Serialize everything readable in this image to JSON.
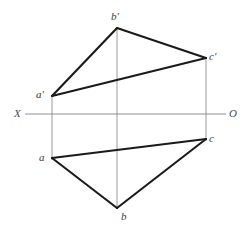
{
  "diagram": {
    "type": "orthographic-projection",
    "background_color": "#ffffff",
    "ground_line": {
      "name": "XO",
      "left_label": "X",
      "right_label": "O",
      "y": 114,
      "x_start": 25,
      "x_end": 226,
      "color": "#8e8e8e",
      "width": 1
    },
    "object_lines": {
      "color": "#1a1a1a",
      "width": 2.1
    },
    "projection_lines": {
      "color": "#9a9a9a",
      "width": 1
    },
    "points": [
      {
        "id": "a_prime",
        "label": "a'",
        "x": 52,
        "y": 96,
        "view": "frontal",
        "label_x": 36,
        "label_y": 89
      },
      {
        "id": "b_prime",
        "label": "b'",
        "x": 117,
        "y": 28,
        "view": "frontal",
        "label_x": 111,
        "label_y": 11
      },
      {
        "id": "c_prime",
        "label": "c'",
        "x": 206,
        "y": 58,
        "view": "frontal",
        "label_x": 209,
        "label_y": 51
      },
      {
        "id": "a",
        "label": "a",
        "x": 52,
        "y": 158,
        "view": "horizontal",
        "label_x": 39,
        "label_y": 152
      },
      {
        "id": "b",
        "label": "b",
        "x": 117,
        "y": 208,
        "view": "horizontal",
        "label_x": 121,
        "label_y": 211
      },
      {
        "id": "c",
        "label": "c",
        "x": 206,
        "y": 139,
        "view": "horizontal",
        "label_x": 209,
        "label_y": 133
      }
    ],
    "edges": [
      {
        "id": "edge-ab-prime",
        "from": "a_prime",
        "to": "b_prime"
      },
      {
        "id": "edge-bc-prime",
        "from": "b_prime",
        "to": "c_prime"
      },
      {
        "id": "edge-ca-prime",
        "from": "c_prime",
        "to": "a_prime"
      },
      {
        "id": "edge-ab",
        "from": "a",
        "to": "b"
      },
      {
        "id": "edge-bc",
        "from": "b",
        "to": "c"
      },
      {
        "id": "edge-ca",
        "from": "c",
        "to": "a"
      }
    ],
    "projectors": [
      {
        "id": "projector-a",
        "x": 52,
        "y_top": 96,
        "y_bottom": 160
      },
      {
        "id": "projector-b",
        "x": 117,
        "y_top": 28,
        "y_bottom": 209
      },
      {
        "id": "projector-c",
        "x": 206,
        "y_top": 58,
        "y_bottom": 141
      }
    ]
  }
}
